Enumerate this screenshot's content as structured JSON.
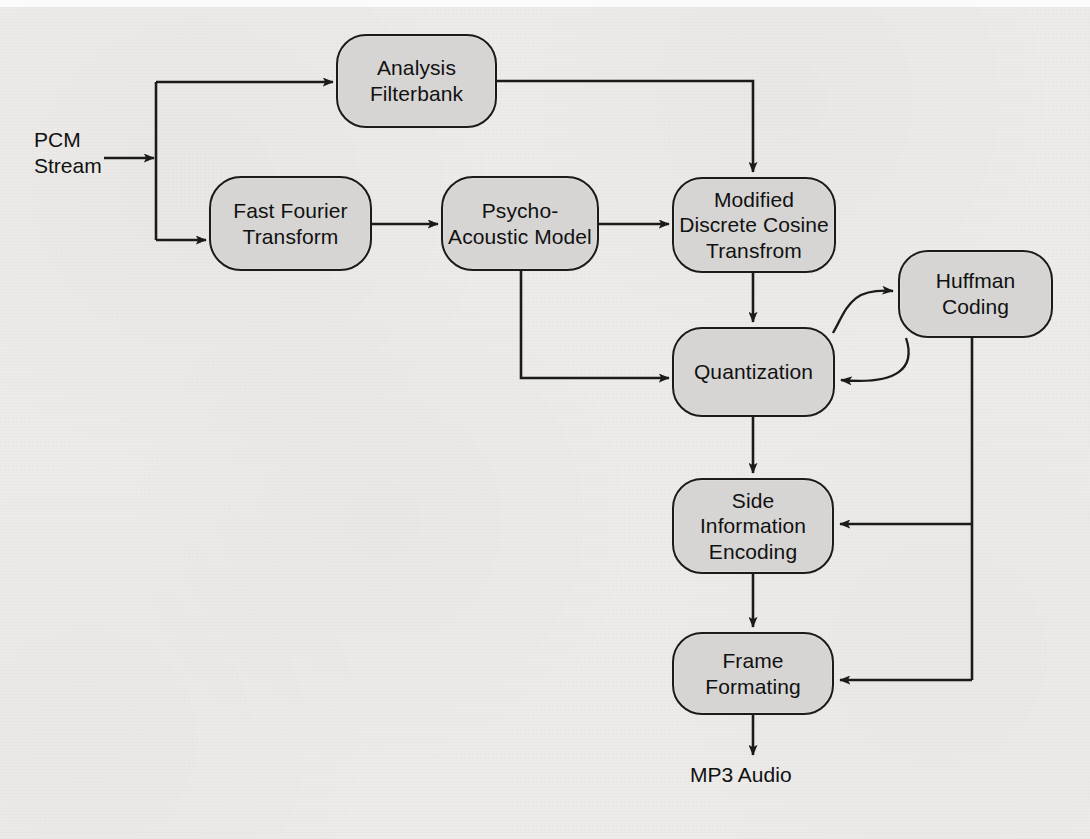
{
  "diagram": {
    "ink_color": "#1b1b1b",
    "node_fill": "#d6d5d3",
    "background_color": "#edecea",
    "nodes": [
      {
        "id": "analysis_filterbank",
        "label": "Analysis\nFilterbank",
        "x": 336,
        "y": 34,
        "w": 161,
        "h": 94,
        "radius": 30
      },
      {
        "id": "fast_fourier_transform",
        "label": "Fast Fourier\nTransform",
        "x": 209,
        "y": 176,
        "w": 163,
        "h": 95,
        "radius": 32
      },
      {
        "id": "psycho_acoustic_model",
        "label": "Psycho-\nAcoustic Model",
        "x": 441,
        "y": 176,
        "w": 158,
        "h": 95,
        "radius": 32
      },
      {
        "id": "mdct",
        "label": "Modified\nDiscrete Cosine\nTransfrom",
        "x": 672,
        "y": 177,
        "w": 164,
        "h": 96,
        "radius": 30
      },
      {
        "id": "huffman_coding",
        "label": "Huffman\nCoding",
        "x": 898,
        "y": 250,
        "w": 155,
        "h": 88,
        "radius": 30
      },
      {
        "id": "quantization",
        "label": "Quantization",
        "x": 672,
        "y": 327,
        "w": 163,
        "h": 90,
        "radius": 30
      },
      {
        "id": "side_information",
        "label": "Side\nInformation\nEncoding",
        "x": 672,
        "y": 478,
        "w": 162,
        "h": 96,
        "radius": 30
      },
      {
        "id": "frame_formating",
        "label": "Frame\nFormating",
        "x": 672,
        "y": 632,
        "w": 162,
        "h": 83,
        "radius": 30
      }
    ],
    "labels": [
      {
        "id": "pcm_stream_label",
        "text": "PCM\nStream",
        "x": 34,
        "y": 127,
        "align": "left"
      },
      {
        "id": "mp3_audio_label",
        "text": "MP3 Audio",
        "x": 690,
        "y": 762,
        "align": "left"
      }
    ],
    "edges": [
      {
        "id": "pcm-to-split",
        "from": "PCM Stream",
        "to": "split point"
      },
      {
        "id": "split-to-analysis",
        "from": "split point",
        "to": "Analysis Filterbank"
      },
      {
        "id": "split-to-fft",
        "from": "split point",
        "to": "Fast Fourier Transform"
      },
      {
        "id": "fft-to-pam",
        "from": "Fast Fourier Transform",
        "to": "Psycho-Acoustic Model"
      },
      {
        "id": "pam-to-mdct",
        "from": "Psycho-Acoustic Model",
        "to": "Modified Discrete Cosine Transfrom"
      },
      {
        "id": "analysis-to-mdct",
        "from": "Analysis Filterbank",
        "to": "Modified Discrete Cosine Transfrom"
      },
      {
        "id": "pam-to-quantization",
        "from": "Psycho-Acoustic Model",
        "to": "Quantization"
      },
      {
        "id": "mdct-to-quantization",
        "from": "Modified Discrete Cosine Transfrom",
        "to": "Quantization"
      },
      {
        "id": "quantization-to-huffman",
        "from": "Quantization",
        "to": "Huffman Coding"
      },
      {
        "id": "huffman-to-quantization",
        "from": "Huffman Coding",
        "to": "Quantization"
      },
      {
        "id": "quantization-to-sideinfo",
        "from": "Quantization",
        "to": "Side Information Encoding"
      },
      {
        "id": "huffman-to-sideinfo",
        "from": "Huffman Coding",
        "to": "Side Information Encoding"
      },
      {
        "id": "sideinfo-to-frame",
        "from": "Side Information Encoding",
        "to": "Frame Formating"
      },
      {
        "id": "huffman-to-frame",
        "from": "Huffman Coding",
        "to": "Frame Formating"
      },
      {
        "id": "frame-to-mp3",
        "from": "Frame Formating",
        "to": "MP3 Audio"
      }
    ]
  }
}
